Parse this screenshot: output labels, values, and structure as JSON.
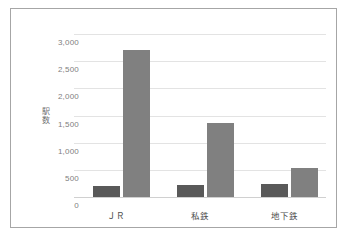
{
  "chart_data": {
    "type": "bar",
    "title": "",
    "xlabel": "",
    "ylabel": "駅数",
    "ylabel_chars": [
      "駅",
      "数"
    ],
    "categories": [
      "ＪＲ",
      "私鉄",
      "地下鉄"
    ],
    "series": [
      {
        "name": "series-1",
        "color": "#595959",
        "values": [
          195,
          225,
          240
        ]
      },
      {
        "name": "series-2",
        "color": "#808080",
        "values": [
          2700,
          1360,
          535
        ]
      }
    ],
    "ylim": [
      0,
      3000
    ],
    "ytick_values": [
      0,
      500,
      1000,
      1500,
      2000,
      2500,
      3000
    ],
    "ytick_labels": [
      "0",
      "500",
      "1,000",
      "1,500",
      "2,000",
      "2,500",
      "3,000"
    ],
    "grid": true,
    "legend": false,
    "legend_position": "none",
    "frame_color": "#a6a6a6",
    "gridline_color": "#e3e3e3",
    "background_color": "#ffffff"
  }
}
